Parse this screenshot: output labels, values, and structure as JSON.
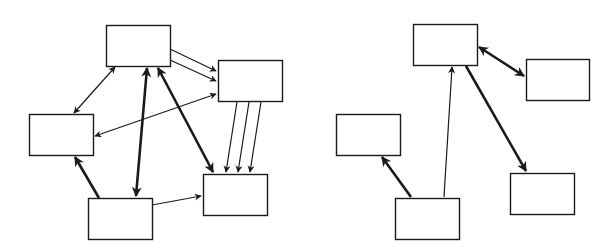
{
  "diagram": {
    "stroke_color": "#1a1a1a",
    "box_fill": "#ffffff",
    "graphs": [
      {
        "id": "left-graph",
        "nodes": [
          {
            "id": "A",
            "x": 106,
            "y": 25,
            "w": 64,
            "h": 41
          },
          {
            "id": "B",
            "x": 218,
            "y": 60,
            "w": 64,
            "h": 41
          },
          {
            "id": "C",
            "x": 29,
            "y": 114,
            "w": 64,
            "h": 41
          },
          {
            "id": "D",
            "x": 203,
            "y": 174,
            "w": 64,
            "h": 41
          },
          {
            "id": "E",
            "x": 88,
            "y": 198,
            "w": 64,
            "h": 41
          }
        ],
        "edges": [
          {
            "from": "A",
            "to": "B",
            "x1": 170,
            "y1": 49,
            "x2": 216,
            "y2": 71,
            "weight": "thin",
            "direction": "forward"
          },
          {
            "from": "A",
            "to": "B",
            "x1": 170,
            "y1": 60,
            "x2": 216,
            "y2": 81,
            "weight": "thin",
            "direction": "forward"
          },
          {
            "from": "A",
            "to": "C",
            "x1": 115,
            "y1": 67,
            "x2": 74,
            "y2": 113,
            "weight": "thin",
            "direction": "both"
          },
          {
            "from": "B",
            "to": "C",
            "x1": 216,
            "y1": 94,
            "x2": 95,
            "y2": 136,
            "weight": "thin",
            "direction": "both"
          },
          {
            "from": "A",
            "to": "E",
            "x1": 147,
            "y1": 68,
            "x2": 136,
            "y2": 196,
            "weight": "thick",
            "direction": "both"
          },
          {
            "from": "A",
            "to": "D",
            "x1": 158,
            "y1": 68,
            "x2": 213,
            "y2": 172,
            "weight": "thick",
            "direction": "both"
          },
          {
            "from": "B",
            "to": "D",
            "x1": 237,
            "y1": 102,
            "x2": 226,
            "y2": 172,
            "weight": "thin",
            "direction": "forward"
          },
          {
            "from": "B",
            "to": "D",
            "x1": 249,
            "y1": 102,
            "x2": 238,
            "y2": 172,
            "weight": "thin",
            "direction": "forward"
          },
          {
            "from": "B",
            "to": "D",
            "x1": 261,
            "y1": 102,
            "x2": 250,
            "y2": 172,
            "weight": "thin",
            "direction": "forward"
          },
          {
            "from": "E",
            "to": "C",
            "x1": 99,
            "y1": 198,
            "x2": 75,
            "y2": 157,
            "weight": "thick",
            "direction": "forward"
          },
          {
            "from": "E",
            "to": "D",
            "x1": 152,
            "y1": 205,
            "x2": 201,
            "y2": 196,
            "weight": "thin",
            "direction": "forward"
          }
        ]
      },
      {
        "id": "right-graph",
        "nodes": [
          {
            "id": "F",
            "x": 413,
            "y": 24,
            "w": 64,
            "h": 41
          },
          {
            "id": "G",
            "x": 526,
            "y": 59,
            "w": 63,
            "h": 41
          },
          {
            "id": "H",
            "x": 336,
            "y": 114,
            "w": 64,
            "h": 41
          },
          {
            "id": "I",
            "x": 510,
            "y": 173,
            "w": 64,
            "h": 41
          },
          {
            "id": "J",
            "x": 395,
            "y": 198,
            "w": 64,
            "h": 41
          }
        ],
        "edges": [
          {
            "from": "F",
            "to": "G",
            "x1": 479,
            "y1": 47,
            "x2": 524,
            "y2": 76,
            "weight": "thick",
            "direction": "both"
          },
          {
            "from": "J",
            "to": "F",
            "x1": 444,
            "y1": 197,
            "x2": 452,
            "y2": 67,
            "weight": "thin",
            "direction": "forward"
          },
          {
            "from": "F",
            "to": "I",
            "x1": 466,
            "y1": 66,
            "x2": 526,
            "y2": 171,
            "weight": "thick",
            "direction": "forward"
          },
          {
            "from": "J",
            "to": "H",
            "x1": 411,
            "y1": 197,
            "x2": 382,
            "y2": 157,
            "weight": "thick",
            "direction": "forward"
          }
        ]
      }
    ]
  }
}
